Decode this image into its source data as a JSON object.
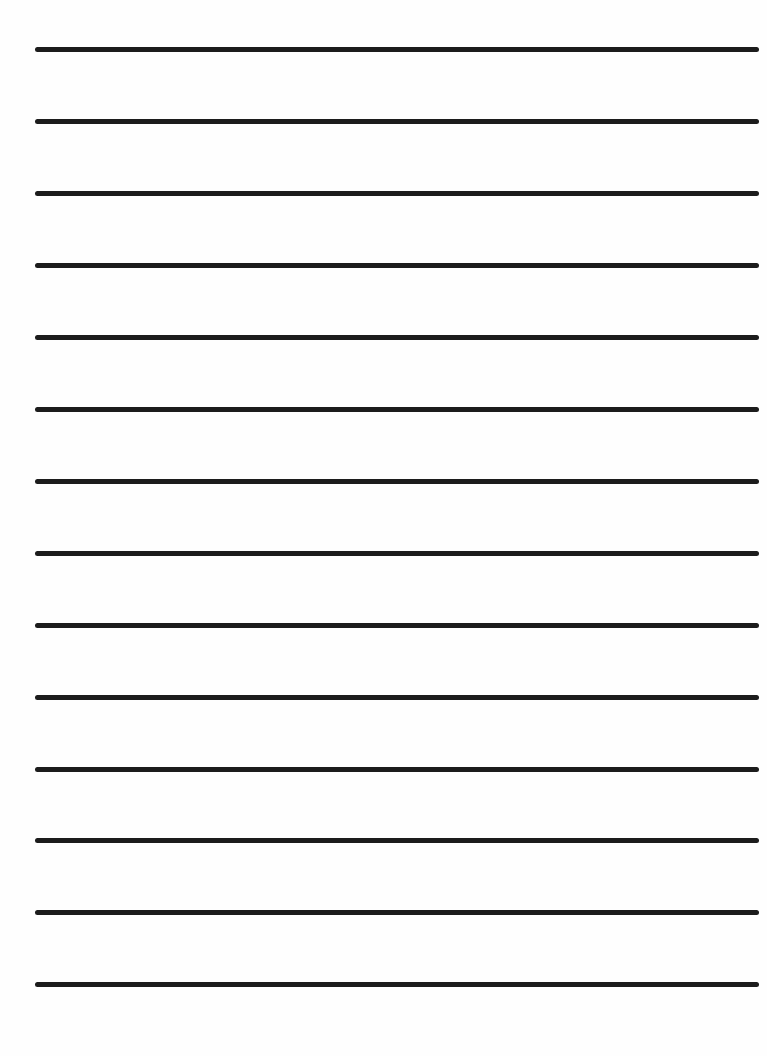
{
  "document": {
    "type": "lined-paper",
    "background_color": "#ffffff",
    "line_color": "#1c1c1c",
    "line_count": 14,
    "line_thickness_px": 5,
    "line_left_px": 35,
    "line_right_px": 759,
    "lines": [
      {
        "index": 1,
        "y": 49
      },
      {
        "index": 2,
        "y": 121
      },
      {
        "index": 3,
        "y": 193
      },
      {
        "index": 4,
        "y": 265
      },
      {
        "index": 5,
        "y": 337
      },
      {
        "index": 6,
        "y": 409
      },
      {
        "index": 7,
        "y": 481
      },
      {
        "index": 8,
        "y": 553
      },
      {
        "index": 9,
        "y": 625
      },
      {
        "index": 10,
        "y": 697
      },
      {
        "index": 11,
        "y": 769
      },
      {
        "index": 12,
        "y": 840
      },
      {
        "index": 13,
        "y": 912
      },
      {
        "index": 14,
        "y": 984
      }
    ]
  }
}
